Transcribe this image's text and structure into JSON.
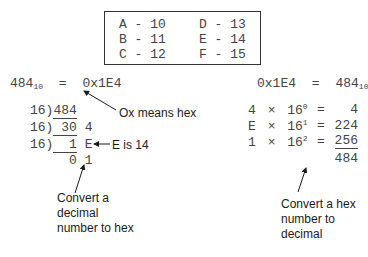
{
  "lookup_table": {
    "rows": [
      {
        "left": "A - 10",
        "right": "D - 13"
      },
      {
        "left": "B - 11",
        "right": "E - 14"
      },
      {
        "left": "C - 12",
        "right": "F - 15"
      }
    ]
  },
  "left": {
    "equation": {
      "lhs": "484",
      "lhs_base": "10",
      "eq": "=",
      "rhs": "0x1E4"
    },
    "annotation_hex": "Ox means hex",
    "division_steps": [
      {
        "divisor": "16)",
        "dividend": "484",
        "remainder": ""
      },
      {
        "divisor": "16)",
        "dividend": " 30",
        "remainder": "4"
      },
      {
        "divisor": "16)",
        "dividend": "  1",
        "remainder": "E"
      }
    ],
    "final_row": {
      "quotient": "0",
      "remainder": "1"
    },
    "annotation_e": "E is 14",
    "caption": "Convert a decimal number to hex"
  },
  "right": {
    "equation": {
      "lhs": "0x1E4",
      "eq": "=",
      "rhs": "484",
      "rhs_base": "10"
    },
    "terms": [
      {
        "digit": "4",
        "times": "×",
        "base": "16",
        "exp": "0",
        "eq": "=",
        "value": "4"
      },
      {
        "digit": "E",
        "times": "×",
        "base": "16",
        "exp": "1",
        "eq": "=",
        "value": "224"
      },
      {
        "digit": "1",
        "times": "×",
        "base": "16",
        "exp": "2",
        "eq": "=",
        "value": "256"
      }
    ],
    "total": "484",
    "caption": "Convert a hex number to decimal"
  }
}
